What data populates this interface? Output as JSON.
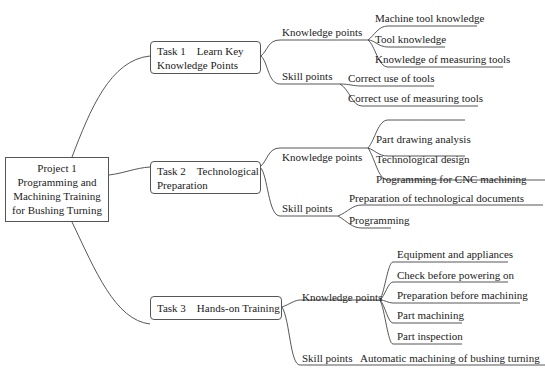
{
  "root": {
    "line1": "Project 1",
    "line2": "Programming and",
    "line3": "Machining Training",
    "line4": "for Bushing Turning"
  },
  "tasks": [
    {
      "line1": "Task 1    Learn Key",
      "line2": "Knowledge Points",
      "knowledge_label": "Knowledge points",
      "knowledge_points": [
        "Machine tool knowledge",
        "Tool knowledge",
        "Knowledge of measuring tools"
      ],
      "skill_label": "Skill points",
      "skill_points": [
        "Correct use of tools",
        "Correct use of measuring tools"
      ]
    },
    {
      "line1": "Task 2    Technological",
      "line2": "Preparation",
      "knowledge_label": "Knowledge points",
      "knowledge_points": [
        "Part drawing analysis",
        "Technological design",
        "Programming for CNC machining"
      ],
      "skill_label": "Skill points",
      "skill_points": [
        "Preparation of technological documents",
        "Programming"
      ]
    },
    {
      "line1": "Task 3    Hands-on Training",
      "knowledge_label": "Knowledge points",
      "knowledge_points": [
        "Equipment and appliances",
        "Check before powering on",
        "Preparation before machining",
        "Part machining",
        "Part inspection"
      ],
      "skill_label": "Skill points",
      "skill_points": [
        "Automatic machining of bushing turning"
      ]
    }
  ]
}
